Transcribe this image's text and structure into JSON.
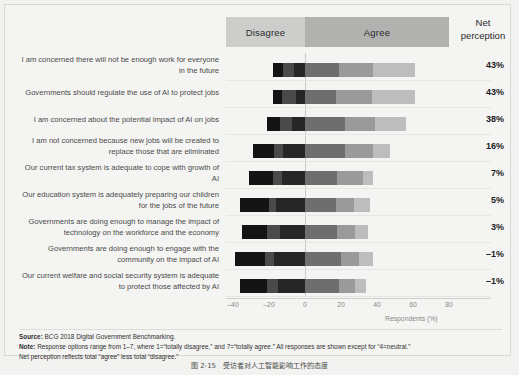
{
  "header": {
    "disagree_label": "Disagree",
    "agree_label": "Agree",
    "net_label_line1": "Net",
    "net_label_line2": "perception"
  },
  "axis": {
    "ticks": [
      "–40",
      "–20",
      "0",
      "20",
      "40",
      "60",
      "80"
    ],
    "tick_values": [
      -40,
      -20,
      0,
      20,
      40,
      60,
      80
    ],
    "title": "Respondents (%)"
  },
  "notes": {
    "source_label": "Source:",
    "source_text": "BCG 2018 Digital Government Benchmarking.",
    "note_label": "Note:",
    "note_text": "Response options range from 1–7, where 1=“totally disagree,” and 7=“totally agree.” All responses are shown except for “4=neutral.”",
    "note_text2": "Net perception reflects total “agree” less total “disagree.”"
  },
  "caption": "图 2-15　受访者对人工智能影响工作的态度",
  "chart_data": {
    "type": "bar",
    "subtype": "diverging-stacked-bar",
    "title": "",
    "xlabel": "Respondents (%)",
    "ylabel": "",
    "xlim": [
      -48,
      90
    ],
    "grid": true,
    "legend_position": "top",
    "bands": [
      {
        "label": "Disagree",
        "range": [
          -44,
          0
        ],
        "color": "#cdcdcb"
      },
      {
        "label": "Agree",
        "range": [
          0,
          80
        ],
        "color": "#b1b1af"
      }
    ],
    "series": [
      {
        "name": "1 = totally disagree",
        "color": "#141414"
      },
      {
        "name": "2",
        "color": "#4a4a4a"
      },
      {
        "name": "3",
        "color": "#262626"
      },
      {
        "name": "5",
        "color": "#6e6e6e"
      },
      {
        "name": "6",
        "color": "#9a9a9a"
      },
      {
        "name": "7 = totally agree",
        "color": "#bdbdbd"
      }
    ],
    "categories": [
      "I am concerned there will not be enough work for everyone in the future",
      "Governments should regulate the use of AI to protect jobs",
      "I am concerned about the potential impact of AI on jobs",
      "I am not concerned because new jobs will be created to replace those that are eliminated",
      "Our current tax system is adequate to cope with growth of AI",
      "Our education system is adequately preparing our children for the jobs of the future",
      "Governments are doing enough to manage the impact of technology on the workforce and the economy",
      "Governments are doing enough to engage with the community on the impact of AI",
      "Our current welfare and social security system is adequate to protect those affected by AI"
    ],
    "rows": [
      {
        "statement": "I am concerned there will not be enough work for everyone in the future",
        "net_perception": "43%",
        "net_value": 43,
        "disagree": [
          -6,
          -12
        ],
        "agree": [
          19,
          19,
          23
        ],
        "start": -18,
        "end": 61
      },
      {
        "statement": "Governments should regulate the use of AI to protect jobs",
        "net_perception": "43%",
        "net_value": 43,
        "disagree": [
          -5,
          -13
        ],
        "agree": [
          17,
          20,
          24
        ],
        "start": -18,
        "end": 61
      },
      {
        "statement": "I am concerned about the potential impact of AI on jobs",
        "net_perception": "38%",
        "net_value": 38,
        "disagree": [
          -7,
          -14
        ],
        "agree": [
          22,
          17,
          17
        ],
        "start": -21,
        "end": 56
      },
      {
        "statement": "I am not concerned because new jobs will be created to replace those that are eliminated",
        "net_perception": "16%",
        "net_value": 16,
        "disagree": [
          -12,
          -17
        ],
        "agree": [
          22,
          16,
          9
        ],
        "start": -29,
        "end": 47
      },
      {
        "statement": "Our current tax system is adequate to cope with growth of AI",
        "net_perception": "7%",
        "net_value": 7,
        "disagree": [
          -13,
          -18
        ],
        "agree": [
          18,
          14,
          6
        ],
        "start": -31,
        "end": 38
      },
      {
        "statement": "Our education system is adequately preparing our children for the jobs of the future",
        "net_perception": "5%",
        "net_value": 5,
        "disagree": [
          -16,
          -20
        ],
        "agree": [
          17,
          10,
          9
        ],
        "start": -36,
        "end": 36
      },
      {
        "statement": "Governments are doing enough to manage the impact of technology on the workforce and the economy",
        "net_perception": "3%",
        "net_value": 3,
        "disagree": [
          -14,
          -21
        ],
        "agree": [
          18,
          10,
          7
        ],
        "start": -35,
        "end": 35
      },
      {
        "statement": "Governments are doing enough to engage with the community on the impact of AI",
        "net_perception": "–1%",
        "net_value": -1,
        "disagree": [
          -17,
          -22
        ],
        "agree": [
          20,
          10,
          8
        ],
        "start": -39,
        "end": 38
      },
      {
        "statement": "Our current welfare and social security system is adequate to protect those affected by AI",
        "net_perception": "–1%",
        "net_value": -1,
        "disagree": [
          -15,
          -21
        ],
        "agree": [
          19,
          9,
          6
        ],
        "start": -36,
        "end": 34
      }
    ]
  }
}
